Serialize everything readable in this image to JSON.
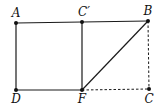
{
  "figure": {
    "points": [
      {
        "id": "A",
        "label": "A"
      },
      {
        "id": "Cp",
        "label": "C′"
      },
      {
        "id": "B",
        "label": "B"
      },
      {
        "id": "D",
        "label": "D"
      },
      {
        "id": "F",
        "label": "F"
      },
      {
        "id": "C",
        "label": "C"
      }
    ],
    "segments": [
      {
        "from": "A",
        "to": "Cp",
        "style": "solid"
      },
      {
        "from": "Cp",
        "to": "B",
        "style": "solid"
      },
      {
        "from": "A",
        "to": "D",
        "style": "solid"
      },
      {
        "from": "D",
        "to": "F",
        "style": "solid"
      },
      {
        "from": "Cp",
        "to": "F",
        "style": "solid"
      },
      {
        "from": "F",
        "to": "B",
        "style": "solid"
      },
      {
        "from": "B",
        "to": "C",
        "style": "dashed"
      },
      {
        "from": "F",
        "to": "C",
        "style": "dashed"
      }
    ]
  }
}
